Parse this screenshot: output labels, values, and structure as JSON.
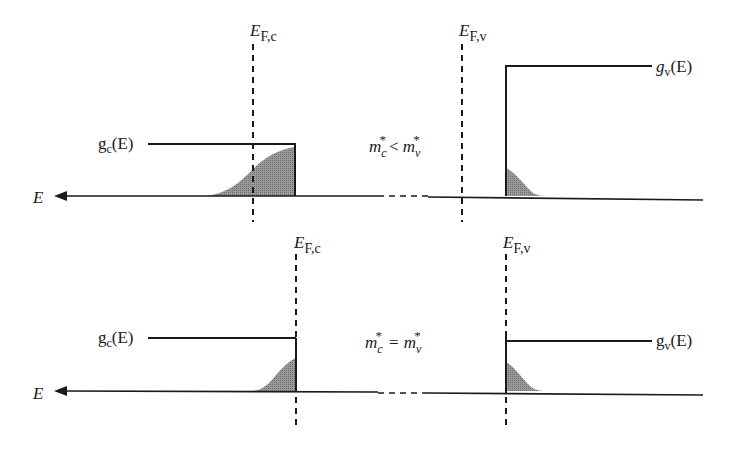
{
  "colors": {
    "line": "#1a1a1a",
    "fill": "#8c8c8c",
    "background": "#ffffff"
  },
  "panels": [
    {
      "id": "top",
      "condition": {
        "m": "m",
        "sub_c": "c",
        "star": "*",
        "relation": "<",
        "sub_v": "v"
      },
      "labels": {
        "axis_E": "E",
        "fermi_c_main": "E",
        "fermi_c_sub": "F,c",
        "fermi_v_main": "E",
        "fermi_v_sub": "F,v",
        "gc_g": "g",
        "gc_sub": "c",
        "gc_arg": "(E)",
        "gv_g": "g",
        "gv_sub": "v",
        "gv_arg": "(E)"
      }
    },
    {
      "id": "bottom",
      "condition": {
        "m": "m",
        "sub_c": "c",
        "star": "*",
        "relation": "=",
        "sub_v": "v"
      },
      "labels": {
        "axis_E": "E",
        "fermi_c_main": "E",
        "fermi_c_sub": "F,c",
        "fermi_v_main": "E",
        "fermi_v_sub": "F,v",
        "gc_g": "g",
        "gc_sub": "c",
        "gc_arg": "(E)",
        "gv_g": "g",
        "gv_sub": "v",
        "gv_arg": "(E)"
      }
    }
  ]
}
